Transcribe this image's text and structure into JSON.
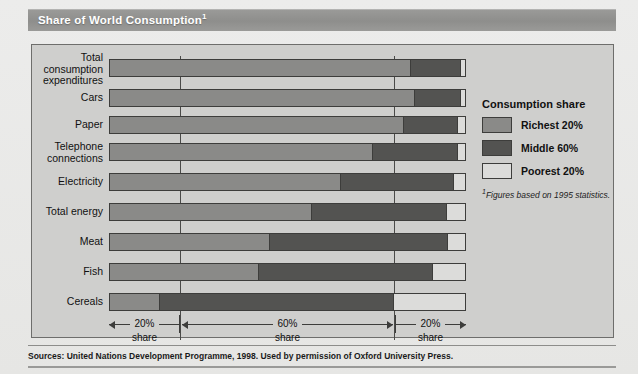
{
  "title": {
    "text": "Share of World Consumption",
    "footnote_marker": "1"
  },
  "legend": {
    "title": "Consumption share",
    "items": [
      {
        "label": "Richest 20%",
        "color": "#8a8a88",
        "key": "richest"
      },
      {
        "label": "Middle 60%",
        "color": "#535351",
        "key": "middle"
      },
      {
        "label": "Poorest 20%",
        "color": "#dcdcda",
        "key": "poorest"
      }
    ],
    "footnote_marker": "1",
    "footnote": "Figures based on 1995 statistics."
  },
  "axis": {
    "segments": [
      {
        "pct": "20%",
        "sub": "share"
      },
      {
        "pct": "60%",
        "sub": "share"
      },
      {
        "pct": "20%",
        "sub": "share"
      }
    ]
  },
  "source": {
    "text": "Sources: United Nations Development Programme, 1998. Used by permission of Oxford University Press."
  },
  "chart_data": {
    "type": "bar",
    "orientation": "horizontal",
    "stacked": true,
    "stacked_normalized": true,
    "title": "Share of World Consumption",
    "xlabel": "",
    "ylabel": "",
    "xlim": [
      0,
      100
    ],
    "grid": true,
    "gridlines": [
      20,
      80
    ],
    "legend_position": "right",
    "categories": [
      "Total\nconsumption\nexpenditures",
      "Cars",
      "Paper",
      "Telephone\nconnections",
      "Electricity",
      "Total energy",
      "Meat",
      "Fish",
      "Cereals"
    ],
    "series": [
      {
        "name": "Richest 20%",
        "color": "#8a8a88",
        "values": [
          85,
          86,
          83,
          74,
          65,
          57,
          45,
          42,
          14
        ]
      },
      {
        "name": "Middle 60%",
        "color": "#535351",
        "values": [
          14,
          13,
          15,
          24,
          32,
          38,
          50,
          49,
          66
        ]
      },
      {
        "name": "Poorest 20%",
        "color": "#dcdcda",
        "values": [
          1,
          1,
          2,
          2,
          3,
          5,
          5,
          9,
          20
        ]
      }
    ],
    "annotations": [
      "20% share",
      "60% share",
      "20% share"
    ],
    "footnote": "Figures based on 1995 statistics."
  }
}
